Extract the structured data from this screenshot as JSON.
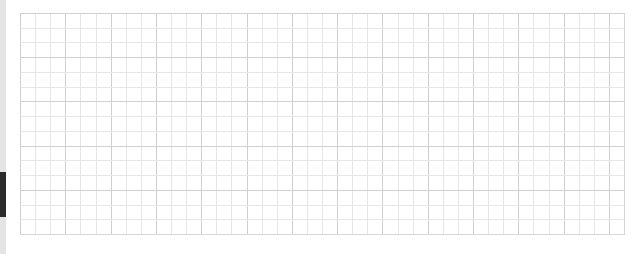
{
  "canvas": {
    "type": "grid-paper",
    "columns": 40,
    "rows": 15,
    "cell_width_px": 15.1,
    "cell_height_px": 14.8,
    "major_every": 3,
    "colors": {
      "background": "#ffffff",
      "minor_line": "#e6e6e6",
      "major_line": "#cfcfcf",
      "left_strip": "#e4e4e4",
      "scroll_indicator": "#2b2b2b"
    }
  },
  "scroll_indicator": {
    "top_px": 172,
    "height_px": 45
  }
}
